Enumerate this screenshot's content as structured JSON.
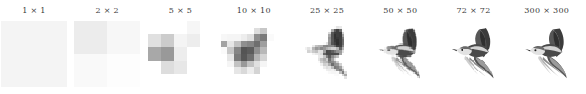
{
  "figure": {
    "background": "#ffffff",
    "title_color": "#3a3a3a"
  },
  "panels": [
    {
      "title": "1 × 1",
      "resolution": 1,
      "label_short": "1x1"
    },
    {
      "title": "2 × 2",
      "resolution": 2,
      "label_short": "2x2"
    },
    {
      "title": "5 × 5",
      "resolution": 5,
      "label_short": "5x5"
    },
    {
      "title": "10 × 10",
      "resolution": 10,
      "label_short": "10x10"
    },
    {
      "title": "25 × 25",
      "resolution": 25,
      "label_short": "25x25"
    },
    {
      "title": "50 × 50",
      "resolution": 50,
      "label_short": "50x50"
    },
    {
      "title": "72 × 72",
      "resolution": 72,
      "label_short": "72x72"
    },
    {
      "title": "300 × 300",
      "resolution": 300,
      "label_short": "300x300"
    }
  ],
  "chart_data": {
    "type": "heatmap",
    "title": "",
    "xlabel": "",
    "ylabel": "",
    "grid": false,
    "legend": "none",
    "colormap": "gray",
    "value_range": [
      0,
      1
    ],
    "note": "Eight grayscale image tiles of one bird photo downsampled to N x N pixels",
    "categories": [
      "1 × 1",
      "2 × 2",
      "5 × 5",
      "10 × 10",
      "25 × 25",
      "50 × 50",
      "72 × 72",
      "300 × 300"
    ],
    "values": [
      1,
      2,
      5,
      10,
      25,
      50,
      72,
      300
    ],
    "series": [
      {
        "name": "1 × 1",
        "resolution": 1,
        "pixels": [
          [
            0.955
          ]
        ]
      },
      {
        "name": "2 × 2",
        "resolution": 2,
        "pixels": [
          [
            0.925,
            0.968
          ],
          [
            0.975,
            0.992
          ]
        ]
      },
      {
        "name": "5 × 5",
        "resolution": 5,
        "pixels": [
          [
            1.0,
            1.0,
            1.0,
            0.965,
            1.0
          ],
          [
            0.88,
            0.8,
            0.955,
            0.93,
            1.0
          ],
          [
            0.66,
            0.6,
            0.93,
            1.0,
            1.0
          ],
          [
            1.0,
            0.865,
            0.905,
            1.0,
            1.0
          ],
          [
            1.0,
            1.0,
            1.0,
            1.0,
            1.0
          ]
        ]
      },
      {
        "name": "10 × 10",
        "resolution": 10,
        "pixels": [
          [
            1.0,
            1.0,
            1.0,
            1.0,
            1.0,
            1.0,
            1.0,
            1.0,
            1.0,
            1.0
          ],
          [
            1.0,
            1.0,
            1.0,
            1.0,
            1.0,
            0.87,
            0.78,
            1.0,
            1.0,
            1.0
          ],
          [
            0.97,
            0.96,
            0.96,
            0.93,
            0.88,
            0.56,
            0.48,
            0.98,
            1.0,
            1.0
          ],
          [
            0.64,
            0.9,
            0.76,
            0.56,
            0.52,
            0.43,
            0.62,
            1.0,
            1.0,
            1.0
          ],
          [
            0.98,
            0.78,
            0.52,
            0.33,
            0.36,
            0.56,
            0.72,
            1.0,
            1.0,
            1.0
          ],
          [
            1.0,
            0.9,
            0.48,
            0.34,
            0.43,
            0.7,
            0.83,
            1.0,
            1.0,
            1.0
          ],
          [
            1.0,
            0.96,
            0.76,
            0.6,
            0.76,
            0.88,
            0.96,
            1.0,
            1.0,
            1.0
          ],
          [
            1.0,
            1.0,
            0.9,
            0.85,
            0.93,
            0.83,
            1.0,
            1.0,
            1.0,
            1.0
          ],
          [
            1.0,
            1.0,
            1.0,
            1.0,
            1.0,
            1.0,
            1.0,
            1.0,
            1.0,
            1.0
          ],
          [
            1.0,
            1.0,
            1.0,
            1.0,
            1.0,
            1.0,
            1.0,
            1.0,
            1.0,
            1.0
          ]
        ]
      },
      {
        "name": "25 × 25",
        "resolution": 25,
        "pixels": "rendered-from-vector"
      },
      {
        "name": "50 × 50",
        "resolution": 50,
        "pixels": "rendered-from-vector"
      },
      {
        "name": "72 × 72",
        "resolution": 72,
        "pixels": "rendered-from-vector"
      },
      {
        "name": "300 × 300",
        "resolution": 300,
        "pixels": "rendered-from-vector"
      }
    ]
  }
}
